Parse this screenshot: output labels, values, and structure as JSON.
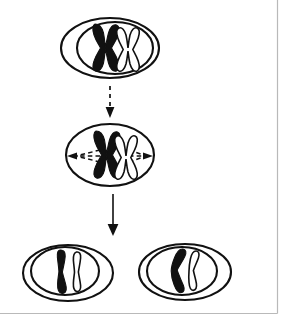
{
  "figure": {
    "background_color": "#ffffff",
    "ink_color": "#111111",
    "frame_color": "#b9b9b9",
    "width": 291,
    "height": 323
  },
  "frame": {
    "right_rule": {
      "x": 277,
      "y1": 0,
      "y2": 313
    },
    "bottom_rule": {
      "y": 313,
      "x1": 0,
      "x2": 277
    }
  },
  "stages": [
    {
      "id": "stage-parent-cell",
      "label": "Parent cell with duplicated chromosomes",
      "phase": "prophase",
      "position": {
        "cx": 110,
        "cy": 48
      },
      "membrane": {
        "cx": 110,
        "cy": 48,
        "rx": 49,
        "ry": 30
      },
      "nucleus": {
        "cx": 115,
        "cy": 48,
        "rx": 38,
        "ry": 26
      },
      "chromosomes": [
        {
          "id": "chromosome-dark-x",
          "shape": "x-shaped",
          "fill": "dark",
          "cx": 104,
          "cy": 48
        },
        {
          "id": "chromosome-light-x",
          "shape": "x-shaped",
          "fill": "light",
          "cx": 126,
          "cy": 49
        }
      ]
    },
    {
      "id": "stage-metaphase-cell",
      "label": "Cell at metaphase with spindle fibers",
      "phase": "metaphase",
      "position": {
        "cx": 110,
        "cy": 155
      },
      "membrane": {
        "cx": 110,
        "cy": 155,
        "rx": 44,
        "ry": 31
      },
      "nucleus": null,
      "chromosomes": [
        {
          "id": "chromosome-dark-x",
          "shape": "x-shaped",
          "fill": "dark",
          "cx": 105,
          "cy": 155
        },
        {
          "id": "chromosome-light-x",
          "shape": "x-shaped",
          "fill": "light",
          "cx": 124,
          "cy": 157
        }
      ],
      "spindle": {
        "label": "spindle fibers",
        "style": "dashed",
        "equator_y": 156,
        "left_tip": {
          "x": 69,
          "y": 156
        },
        "right_tip": {
          "x": 152,
          "y": 156
        }
      }
    },
    {
      "id": "stage-daughter-cell-left",
      "label": "Left daughter cell",
      "phase": "telophase",
      "position": {
        "cx": 68,
        "cy": 273
      },
      "membrane": {
        "cx": 68,
        "cy": 273,
        "rx": 45,
        "ry": 28
      },
      "nucleus": {
        "cx": 65,
        "cy": 271,
        "rx": 34,
        "ry": 24
      },
      "chromosomes": [
        {
          "id": "chromatid-dark",
          "shape": "rod",
          "fill": "dark",
          "cx": 64,
          "cy": 272
        },
        {
          "id": "chromatid-light",
          "shape": "rod",
          "fill": "light",
          "cx": 78,
          "cy": 272
        }
      ]
    },
    {
      "id": "stage-daughter-cell-right",
      "label": "Right daughter cell",
      "phase": "telophase",
      "position": {
        "cx": 185,
        "cy": 272
      },
      "membrane": {
        "cx": 185,
        "cy": 272,
        "rx": 46,
        "ry": 28
      },
      "nucleus": {
        "cx": 182,
        "cy": 271,
        "rx": 35,
        "ry": 24
      },
      "chromosomes": [
        {
          "id": "chromatid-dark",
          "shape": "bent-rod",
          "fill": "dark",
          "cx": 180,
          "cy": 272
        },
        {
          "id": "chromatid-light",
          "shape": "bent-rod",
          "fill": "light",
          "cx": 194,
          "cy": 272
        }
      ]
    }
  ],
  "arrows": [
    {
      "id": "arrow-parent-to-metaphase",
      "label": "Transition from parent cell to metaphase",
      "style": "dashed",
      "x": 110,
      "y1": 86,
      "y2": 116,
      "direction": "down"
    },
    {
      "id": "arrow-metaphase-to-daughters",
      "label": "Transition from metaphase to daughter cells",
      "style": "solid",
      "x": 113,
      "y1": 194,
      "y2": 234,
      "direction": "down"
    }
  ]
}
